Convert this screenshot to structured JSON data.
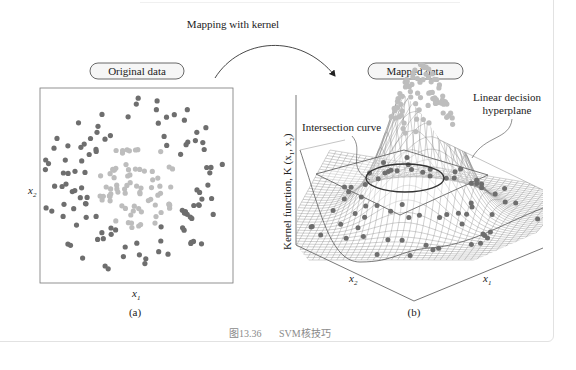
{
  "figure": {
    "mapping_label": "Mapping with kernel",
    "caption_number": "图13.36",
    "caption_text": "SVM核技巧"
  },
  "panel_a": {
    "title": "Original data",
    "x_axis_label": "x",
    "x_axis_sub": "1",
    "y_axis_label": "x",
    "y_axis_sub": "2",
    "sublabel": "(a)"
  },
  "panel_b": {
    "title": "Mapped data",
    "z_axis_label": "Kernel function, K (x",
    "z_axis_sub1": "1",
    "z_axis_mid": ", x",
    "z_axis_sub2": "2",
    "z_axis_end": ")",
    "annotation_intersection": "Intersection curve",
    "annotation_plane_line1": "Linear decision",
    "annotation_plane_line2": "hyperplane",
    "x1_label": "x",
    "x1_sub": "1",
    "x2_label": "x",
    "x2_sub": "2",
    "sublabel": "(b)"
  },
  "colors": {
    "outer_class": "#6e6e6e",
    "inner_class": "#bdbdbd",
    "axis": "#555555",
    "mesh": "#7a7a7a",
    "caption": "#8a8a8a"
  }
}
